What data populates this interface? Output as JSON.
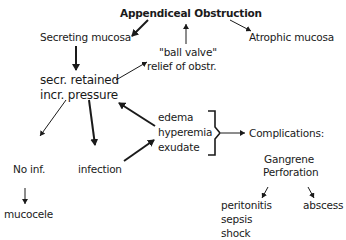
{
  "diagram": {
    "title": "Appendiceal Obstruction",
    "nodes": {
      "secreting_mucosa": "Secreting mucosa",
      "atrophic_mucosa": "Atrophic mucosa",
      "ball_valve_1": "\"ball valve\"",
      "ball_valve_2": "relief of obstr.",
      "secr_retained": "secr. retained",
      "incr_pressure": "incr. pressure",
      "edema": "edema",
      "hyperemia": "hyperemia",
      "exudate": "exudate",
      "complications": "Complications:",
      "gangrene": "Gangrene",
      "perforation": "Perforation",
      "no_inf": "No inf.",
      "infection": "infection",
      "mucocele": "mucocele",
      "peritonitis": "peritonitis",
      "sepsis": "sepsis",
      "shock": "shock",
      "abscess": "abscess"
    },
    "edges": [
      {
        "from": "Appendiceal Obstruction",
        "to": "Secreting mucosa",
        "style": "bold-arrow"
      },
      {
        "from": "Appendiceal Obstruction",
        "to": "Atrophic mucosa",
        "style": "thin-arrow"
      },
      {
        "from": "\"ball valve\" relief of obstr.",
        "to": "Appendiceal Obstruction",
        "style": "thin-arrow"
      },
      {
        "from": "Secreting mucosa",
        "to": "secr. retained incr. pressure",
        "style": "bold-arrow"
      },
      {
        "from": "secr. retained",
        "to": "\"ball valve\" relief of obstr.",
        "style": "thin-arrow"
      },
      {
        "from": "incr. pressure",
        "to": "No inf.",
        "style": "thin-arrow"
      },
      {
        "from": "incr. pressure",
        "to": "infection",
        "style": "bold-arrow"
      },
      {
        "from": "edema/hyperemia/exudate",
        "to": "incr. pressure",
        "style": "bold-arrow"
      },
      {
        "from": "infection",
        "to": "edema/hyperemia/exudate",
        "style": "bold-arrow"
      },
      {
        "from": "edema/hyperemia/exudate",
        "to": "Complications:",
        "style": "brace-arrow"
      },
      {
        "from": "No inf.",
        "to": "mucocele",
        "style": "thin-arrow"
      },
      {
        "from": "Perforation",
        "to": "peritonitis",
        "style": "thin-arrow"
      },
      {
        "from": "Perforation",
        "to": "abscess",
        "style": "thin-arrow"
      }
    ]
  }
}
